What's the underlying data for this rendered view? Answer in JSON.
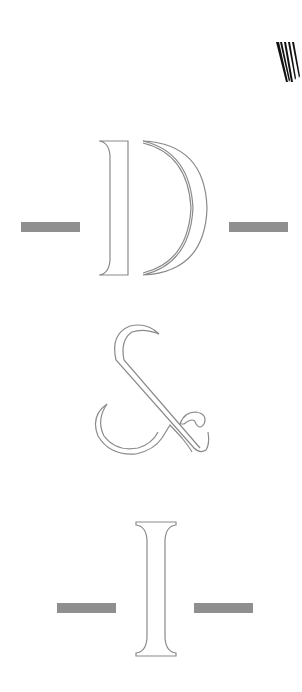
{
  "graphic": {
    "title": "D & I",
    "letters": [
      {
        "char": "D",
        "label": "Letter D"
      },
      {
        "char": "&",
        "label": "Ampersand"
      },
      {
        "char": "I",
        "label": "Letter I"
      }
    ],
    "corner_mark": "W",
    "colors": {
      "background": "#ffffff",
      "bar": "#8f8f8f",
      "outline": "#8a8a8a",
      "corner_mark": "#111111"
    }
  }
}
